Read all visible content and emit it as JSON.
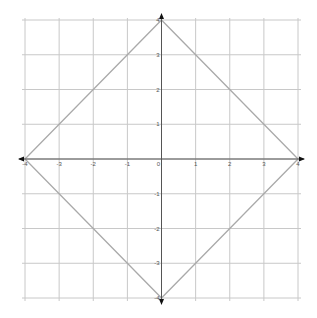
{
  "chart_data": {
    "type": "line",
    "title": "",
    "xlabel": "",
    "ylabel": "",
    "xlim": [
      -4,
      4
    ],
    "ylim": [
      -4,
      4
    ],
    "grid": true,
    "x_ticks": [
      -4,
      -3,
      -2,
      -1,
      0,
      1,
      2,
      3,
      4
    ],
    "y_ticks": [
      -4,
      -3,
      -2,
      -1,
      1,
      2,
      3,
      4
    ],
    "x_tick_labels": [
      "-4",
      "-3",
      "-2",
      "-1",
      "0",
      "1",
      "2",
      "3",
      "4"
    ],
    "y_tick_labels": [
      "-4",
      "-3",
      "-2",
      "-1",
      "1",
      "2",
      "3",
      "4"
    ],
    "series": [
      {
        "name": "diamond |x|+|y|=4",
        "x": [
          4,
          0,
          -4,
          0,
          4
        ],
        "y": [
          0,
          4,
          0,
          -4,
          0
        ]
      }
    ],
    "legend": null
  },
  "colors": {
    "grid": "#c8c8c8",
    "axis": "#555555",
    "shape": "#aaaaaa",
    "arrow": "#111111"
  }
}
